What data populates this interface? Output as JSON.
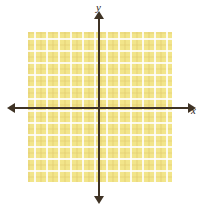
{
  "figure": {
    "background_color": "#ffffff"
  },
  "chart_data": {
    "type": "scatter",
    "title": "",
    "subtitle": "",
    "xlabel": "x",
    "ylabel": "y",
    "series": [],
    "x": [],
    "values": [],
    "annotations": [],
    "grid": true,
    "grid_color": "#ffffff",
    "grid_cell_size_px": 12,
    "grid_columns": 12,
    "grid_rows": 12,
    "plot_fill_color": "#f2e58a",
    "axis_color": "#3f3325",
    "legend": "none",
    "xlim": [
      -6,
      6
    ],
    "ylim": [
      -6,
      6
    ],
    "xticks": [],
    "yticks": [],
    "origin_px": [
      99,
      108
    ]
  },
  "axes": {
    "x": {
      "label": "x",
      "arrow_left": "arrow-left",
      "arrow_right": "arrow-right"
    },
    "y": {
      "label": "y",
      "arrow_up": "arrow-up",
      "arrow_down": "arrow-down"
    }
  },
  "colors": {
    "grid_fill": "#f2e58a",
    "grid_line": "#ffffff",
    "axis": "#3f3325",
    "label": "#2a2218",
    "page_background": "#ffffff"
  }
}
